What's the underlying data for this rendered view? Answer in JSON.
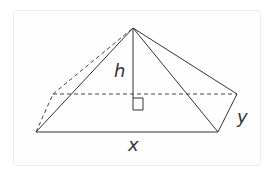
{
  "diagram": {
    "labels": {
      "height": "h",
      "width": "x",
      "depth": "y"
    },
    "colors": {
      "line": "#333333",
      "border": "#ececec"
    }
  }
}
